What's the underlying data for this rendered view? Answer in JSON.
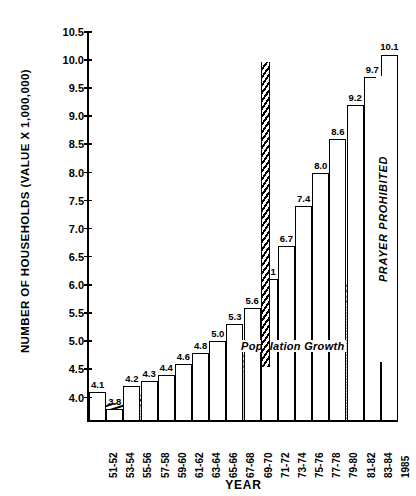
{
  "chart_data": {
    "type": "bar",
    "title": "",
    "xlabel": "YEAR",
    "ylabel": "NUMBER OF HOUSEHOLDS  (VALUE X  1,000,000)",
    "ylim": [
      3.6,
      10.5
    ],
    "ytick_labels": [
      "10.5",
      "10.0",
      "9.5",
      "9.0",
      "8.5",
      "8.0",
      "7.5",
      "7.0",
      "6.5",
      "6.0",
      "5.5",
      "5.0",
      "4.5",
      "4.0"
    ],
    "ytick_values": [
      10.5,
      10.0,
      9.5,
      9.0,
      8.5,
      8.0,
      7.5,
      7.0,
      6.5,
      6.0,
      5.5,
      5.0,
      4.5,
      4.0
    ],
    "grid": false,
    "legend_position": "none",
    "categories": [
      "51-52",
      "53-54",
      "55-56",
      "57-58",
      "59-60",
      "61-62",
      "63-64",
      "65-66",
      "67-68",
      "69-70",
      "71-72",
      "73-74",
      "75-76",
      "77-78",
      "79-80",
      "81-82",
      "83-84",
      "1985"
    ],
    "values": [
      4.1,
      3.8,
      4.2,
      4.3,
      4.4,
      4.6,
      4.8,
      5.0,
      5.3,
      5.6,
      6.1,
      6.7,
      7.4,
      8.0,
      8.6,
      9.2,
      9.7,
      10.1
    ],
    "data_labels": [
      "4.1",
      "3.8",
      "4.2",
      "4.3",
      "4.4",
      "4.6",
      "4.8",
      "5.0",
      "5.3",
      "5.6",
      "6.1",
      "6.7",
      "7.4",
      "8.0",
      "8.6",
      "9.2",
      "9.7",
      "10.1"
    ],
    "series": [
      {
        "name": "Number of Households",
        "values": [
          4.1,
          3.8,
          4.2,
          4.3,
          4.4,
          4.6,
          4.8,
          5.0,
          5.3,
          5.6,
          6.1,
          6.7,
          7.4,
          8.0,
          8.6,
          9.2,
          9.7,
          10.1
        ]
      },
      {
        "name": "Population Growth",
        "values": [
          3.85,
          3.9,
          3.97,
          4.05,
          4.12,
          4.22,
          4.35,
          4.48,
          4.62,
          4.78,
          4.95,
          5.15,
          5.36,
          5.58,
          5.8,
          6.03,
          6.26,
          6.5
        ]
      }
    ],
    "annotations": [
      {
        "name": "prayer-prohibited",
        "text": "PRAYER  PROHIBITED",
        "orientation": "vertical",
        "x_category": "61-62"
      },
      {
        "name": "population-growth",
        "text": "Population   Growth",
        "orientation": "horizontal"
      }
    ],
    "colors": {
      "line": "#000000",
      "bar_fill": "#ffffff",
      "population_fill": "#cfcfcf",
      "background": "#ffffff"
    }
  }
}
